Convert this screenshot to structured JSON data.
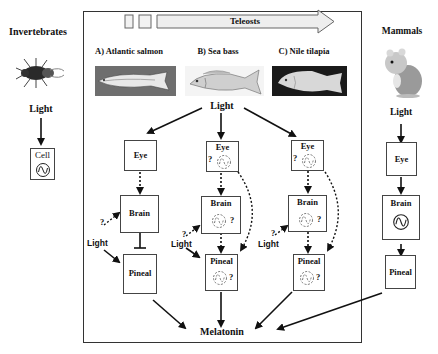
{
  "invertebrates": {
    "title": "Invertebrates",
    "light": "Light",
    "cell": "Cell"
  },
  "teleosts": {
    "banner": "Teleosts",
    "species": [
      {
        "label": "A) Atlantic salmon",
        "eye": "Eye",
        "brain": "Brain",
        "pineal": "Pineal",
        "light": "Light",
        "q": "?"
      },
      {
        "label": "B) Sea bass",
        "eye": "Eye",
        "brain": "Brain",
        "pineal": "Pineal",
        "light": "Light",
        "q": "?"
      },
      {
        "label": "C) Nile tilapia",
        "eye": "Eye",
        "brain": "Brain",
        "pineal": "Pineal",
        "light": "Light",
        "q": "?"
      }
    ],
    "light": "Light",
    "output": "Melatonin"
  },
  "mammals": {
    "title": "Mammals",
    "light": "Light",
    "eye": "Eye",
    "brain": "Brain",
    "pineal": "Pineal"
  },
  "colors": {
    "line": "#111111",
    "box_border": "#444444",
    "dashed_oscillator": "#777777",
    "banner_fill": "#eeeeee"
  }
}
